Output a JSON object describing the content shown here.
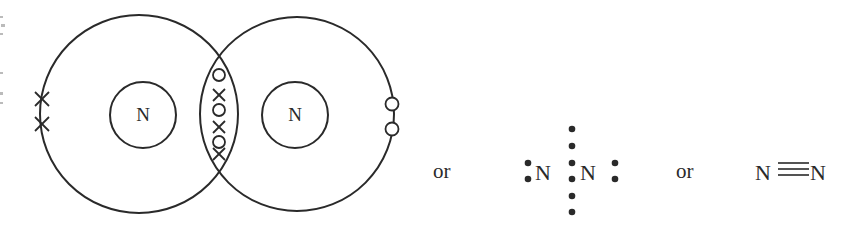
{
  "diagram": {
    "dot_cross": {
      "atoms": [
        {
          "symbol": "N",
          "outer_cx": 139,
          "outer_cy": 114,
          "outer_r": 99,
          "nucleus_cx": 143,
          "nucleus_cy": 115,
          "nucleus_r": 33,
          "marker": "cross"
        },
        {
          "symbol": "N",
          "outer_cx": 297,
          "outer_cy": 114,
          "outer_r": 97,
          "nucleus_cx": 295,
          "nucleus_cy": 115,
          "nucleus_r": 33,
          "marker": "circle"
        }
      ],
      "shared_electrons": [
        "O",
        "X",
        "O",
        "X",
        "O",
        "X"
      ],
      "left_lone_pair": [
        "X",
        "X"
      ],
      "right_lone_pair": [
        "O",
        "O"
      ]
    },
    "connector_1": "or",
    "lewis": {
      "atom_left": "N",
      "atom_right": "N",
      "shared_dots": 6
    },
    "connector_2": "or",
    "structural": {
      "atom_left": "N",
      "bond": "≡",
      "atom_right": "N"
    },
    "colors": {
      "ink": "#2a2a2a",
      "background": "#ffffff"
    }
  }
}
